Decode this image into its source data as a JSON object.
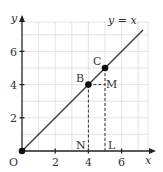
{
  "diagram": {
    "type": "coordinate-plane",
    "line_label": "y = x",
    "axes": {
      "x_label": "x",
      "y_label": "y",
      "origin_label": "O",
      "x_ticks": [
        "2",
        "4",
        "6"
      ],
      "y_ticks": [
        "2",
        "4",
        "6"
      ]
    },
    "points": {
      "B": {
        "label": "B",
        "x": 4,
        "y": 4
      },
      "C": {
        "label": "C",
        "x": 5,
        "y": 5
      },
      "M": {
        "label": "M",
        "x": 5,
        "y": 4
      },
      "N": {
        "label": "N",
        "x": 4,
        "y": 0
      },
      "L": {
        "label": "L",
        "x": 5,
        "y": 0
      }
    },
    "colors": {
      "grid": "#dcdcdc",
      "axis": "#222222",
      "line": "#333333",
      "point": "#111111"
    }
  }
}
